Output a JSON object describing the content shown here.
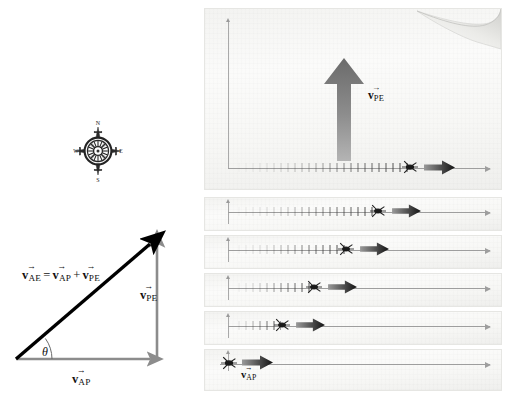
{
  "figure": {
    "domain": "physics-vector-diagram"
  },
  "compass": {
    "name": "compass-rose",
    "north": "N",
    "east": "E",
    "south": "S",
    "west": "W"
  },
  "vector_triangle": {
    "equation": {
      "lhs_symbol": "v",
      "lhs_sub": "AE",
      "equals": "=",
      "term1_symbol": "v",
      "term1_sub": "AP",
      "plus": "+",
      "term2_symbol": "v",
      "term2_sub": "PE",
      "plain_text": "v⃗AE = v⃗AP + v⃗PE"
    },
    "vertical_label": {
      "symbol": "v",
      "sub": "PE"
    },
    "horizontal_label": {
      "symbol": "v",
      "sub": "AP"
    },
    "angle_label": "θ",
    "colors": {
      "resultant": "#000000",
      "component": "#8c8c8c"
    }
  },
  "panels": {
    "wind_arrow_label": {
      "symbol": "v",
      "sub": "PE"
    },
    "plane_arrow_label": {
      "symbol": "v",
      "sub": "AP"
    },
    "frames": [
      {
        "id": "frame-1",
        "trail_length_px": 178,
        "insect_x_px": 144,
        "arrow_x_px": 166
      },
      {
        "id": "frame-2",
        "trail_length_px": 146,
        "insect_x_px": 120,
        "arrow_x_px": 141
      },
      {
        "id": "frame-3",
        "trail_length_px": 114,
        "insect_x_px": 92,
        "arrow_x_px": 113
      },
      {
        "id": "frame-4",
        "trail_length_px": 82,
        "insect_x_px": 68,
        "arrow_x_px": 89
      },
      {
        "id": "frame-5",
        "trail_length_px": 50,
        "insect_x_px": 42,
        "arrow_x_px": 63
      },
      {
        "id": "frame-6",
        "trail_length_px": 0,
        "insect_x_px": 18,
        "arrow_x_px": 38
      }
    ],
    "colors": {
      "panel_bg": "#f7f7f5",
      "panel_edge": "#e6e6e3",
      "axis": "#9e9e9e",
      "wind_arrow": "#6e6e6e",
      "plane_arrow_dark": "#1b1b1b"
    }
  }
}
